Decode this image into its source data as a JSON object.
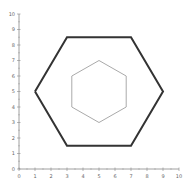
{
  "chart_data": {
    "type": "line",
    "title": "",
    "xlabel": "",
    "ylabel": "",
    "xlim": [
      0,
      10
    ],
    "ylim": [
      0,
      10
    ],
    "grid": false,
    "x_ticks": [
      "0",
      "1",
      "2",
      "3",
      "4",
      "5",
      "6",
      "7",
      "8",
      "9",
      "10"
    ],
    "y_ticks": [
      "0",
      "1",
      "2",
      "3",
      "4",
      "5",
      "6",
      "7",
      "8",
      "9",
      "10"
    ],
    "series": [
      {
        "name": "outer hexagon",
        "color": "#333333",
        "line_width": 2,
        "points": [
          [
            1,
            5
          ],
          [
            3,
            8.5
          ],
          [
            7,
            8.5
          ],
          [
            9,
            5
          ],
          [
            7,
            1.5
          ],
          [
            3,
            1.5
          ],
          [
            1,
            5
          ]
        ]
      },
      {
        "name": "inner hexagon",
        "color": "#aaaaaa",
        "line_width": 1,
        "points": [
          [
            5,
            7
          ],
          [
            6.7,
            6
          ],
          [
            6.7,
            4
          ],
          [
            5,
            3
          ],
          [
            3.3,
            4
          ],
          [
            3.3,
            6
          ],
          [
            5,
            7
          ]
        ]
      }
    ]
  },
  "colors": {
    "axis": "#888888",
    "outer": "#333333",
    "inner": "#aaaaaa"
  }
}
